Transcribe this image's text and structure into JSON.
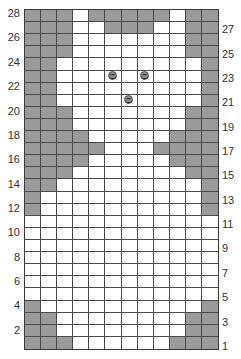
{
  "chart": {
    "columns": 12,
    "rows": 28,
    "colors": {
      "shaded": "#9a9a9a",
      "empty": "#ffffff",
      "grid_line": "#4a4a4a",
      "symbol": "#8c8c8c"
    },
    "legend_labels": {
      "left": [
        "28",
        "26",
        "24",
        "22",
        "20",
        "18",
        "16",
        "14",
        "12",
        "10",
        "8",
        "6",
        "4",
        "2"
      ],
      "right": [
        "27",
        "25",
        "23",
        "21",
        "19",
        "17",
        "15",
        "13",
        "11",
        "9",
        "7",
        "5",
        "3",
        "1"
      ]
    },
    "rows_data": [
      {
        "row": 28,
        "shaded": [
          1,
          2,
          3,
          5,
          6,
          7,
          8,
          9,
          11,
          12
        ],
        "symbols": []
      },
      {
        "row": 27,
        "shaded": [
          1,
          2,
          3,
          6,
          7,
          8,
          11,
          12
        ],
        "symbols": []
      },
      {
        "row": 26,
        "shaded": [
          1,
          2,
          3,
          11,
          12
        ],
        "symbols": []
      },
      {
        "row": 25,
        "shaded": [
          1,
          2,
          3,
          11,
          12
        ],
        "symbols": []
      },
      {
        "row": 24,
        "shaded": [
          1,
          2,
          12
        ],
        "symbols": []
      },
      {
        "row": 23,
        "shaded": [
          1,
          2,
          12
        ],
        "symbols": [
          6,
          8
        ]
      },
      {
        "row": 22,
        "shaded": [
          1,
          2,
          12
        ],
        "symbols": []
      },
      {
        "row": 21,
        "shaded": [
          1,
          2,
          12
        ],
        "symbols": [
          7
        ]
      },
      {
        "row": 20,
        "shaded": [
          1,
          2,
          3,
          11,
          12
        ],
        "symbols": []
      },
      {
        "row": 19,
        "shaded": [
          1,
          2,
          3,
          11,
          12
        ],
        "symbols": []
      },
      {
        "row": 18,
        "shaded": [
          1,
          2,
          3,
          4,
          10,
          11,
          12
        ],
        "symbols": []
      },
      {
        "row": 17,
        "shaded": [
          1,
          2,
          3,
          4,
          5,
          9,
          10,
          11,
          12
        ],
        "symbols": []
      },
      {
        "row": 16,
        "shaded": [
          1,
          2,
          3,
          4,
          10,
          11,
          12
        ],
        "symbols": []
      },
      {
        "row": 15,
        "shaded": [
          1,
          2,
          3,
          11,
          12
        ],
        "symbols": []
      },
      {
        "row": 14,
        "shaded": [
          1,
          2,
          12
        ],
        "symbols": []
      },
      {
        "row": 13,
        "shaded": [
          1,
          12
        ],
        "symbols": []
      },
      {
        "row": 12,
        "shaded": [
          1,
          12
        ],
        "symbols": []
      },
      {
        "row": 11,
        "shaded": [],
        "symbols": []
      },
      {
        "row": 10,
        "shaded": [],
        "symbols": []
      },
      {
        "row": 9,
        "shaded": [],
        "symbols": []
      },
      {
        "row": 8,
        "shaded": [],
        "symbols": []
      },
      {
        "row": 7,
        "shaded": [],
        "symbols": []
      },
      {
        "row": 6,
        "shaded": [],
        "symbols": []
      },
      {
        "row": 5,
        "shaded": [],
        "symbols": []
      },
      {
        "row": 4,
        "shaded": [
          1,
          12
        ],
        "symbols": []
      },
      {
        "row": 3,
        "shaded": [
          1,
          2,
          11,
          12
        ],
        "symbols": []
      },
      {
        "row": 2,
        "shaded": [
          1,
          2,
          11,
          12
        ],
        "symbols": []
      },
      {
        "row": 1,
        "shaded": [
          1,
          2,
          3,
          10,
          11,
          12
        ],
        "symbols": []
      }
    ],
    "symbol_icon": "bobble-knot-icon"
  }
}
